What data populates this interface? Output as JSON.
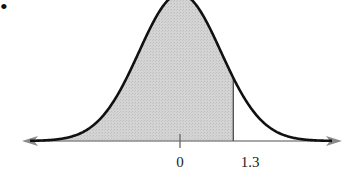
{
  "chart_data": {
    "type": "area",
    "title": "",
    "distribution": {
      "name": "standard normal",
      "mean": 0,
      "sd": 1
    },
    "shaded_region": {
      "from": "-inf",
      "to": 1.3
    },
    "x_ticks": [
      {
        "value": 0,
        "label": "0"
      },
      {
        "value": 1.3,
        "label": "1.3"
      }
    ],
    "xlabel": "",
    "ylabel": "",
    "grid": false,
    "legend": null,
    "axis_arrows": true
  },
  "marker": {
    "bullet": "•"
  },
  "colors": {
    "curve": "#111111",
    "fill": "#cfcfcf",
    "axis": "#8a8a8a",
    "boundary": "#555555"
  },
  "labels": {
    "tick_0": "0",
    "tick_1_3": "1.3"
  }
}
